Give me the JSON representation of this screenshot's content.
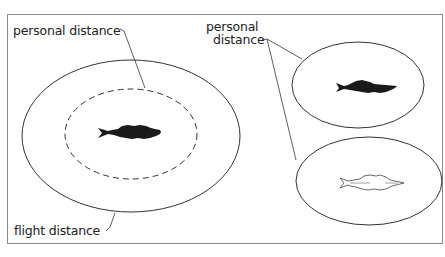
{
  "diagram": {
    "labels": {
      "left_personal": "personal distance",
      "flight": "flight distance",
      "right_personal_line1": "personal",
      "right_personal_line2": "distance"
    },
    "colors": {
      "stroke": "#333333",
      "fish_dark": "#1a1a1a",
      "frame": "#8a8a8a",
      "background": "#ffffff"
    },
    "shapes": {
      "outer_ellipse": "flight-distance-zone",
      "inner_dashed_ellipse": "personal-distance-zone",
      "right_top_ellipse": "personal-distance-zone-dark-fish",
      "right_bottom_ellipse": "personal-distance-zone-light-fish"
    }
  }
}
